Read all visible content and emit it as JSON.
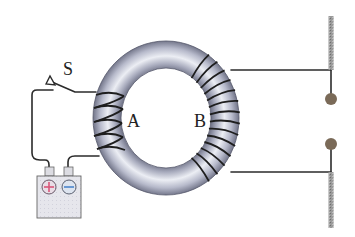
{
  "diagram": {
    "labels": {
      "switch": "S",
      "coil_a": "A",
      "coil_b": "B",
      "positive": "+",
      "negative": "−"
    },
    "components": [
      {
        "id": "torus",
        "name": "iron ring core"
      },
      {
        "id": "coil_a",
        "name": "coil A",
        "turns": 4
      },
      {
        "id": "coil_b",
        "name": "coil B",
        "turns": 14
      },
      {
        "id": "switch",
        "name": "switch S",
        "state": "open"
      },
      {
        "id": "battery",
        "name": "battery"
      },
      {
        "id": "electrodes",
        "name": "spark gap electrodes",
        "count": 2
      }
    ],
    "colors": {
      "core": "#b9bccb",
      "core_dark": "#6d7084",
      "wire": "#2b2b2b",
      "positive": "#d9577a",
      "negative": "#5b8fd0",
      "battery_body": "#e4e4ea",
      "electrode_ball": "#7a6a58",
      "rod": "#8d8d8d"
    }
  }
}
